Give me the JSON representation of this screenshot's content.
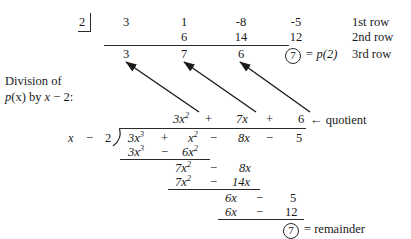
{
  "figure": {
    "title_note": "Synthetic division and long division of p(x) by x - 2",
    "ink_color": "#1a1a1a",
    "rule_color": "#2a2a2a"
  },
  "synthetic": {
    "divisor_value": "2",
    "row1": [
      "3",
      "1",
      "-8",
      "-5"
    ],
    "row2": [
      "6",
      "14",
      "12"
    ],
    "row3": [
      "3",
      "7",
      "6"
    ],
    "circled_value": "7",
    "equals_text": "= p(2)",
    "row_labels": [
      "1st row",
      "2nd row",
      "3rd row"
    ]
  },
  "caption": {
    "line1": "Division of",
    "line2_p": "p",
    "line2_paren": "(x)",
    "line2_by": " by ",
    "line2_x": "x",
    "line2_rest": " − 2:"
  },
  "longdivision": {
    "quotient": {
      "t1_coef": "3",
      "t1_var": "x",
      "t1_exp": "2",
      "op1": "+",
      "t2_coef": "7",
      "t2_var": "x",
      "op2": "+",
      "t3": "6",
      "arrow_label": "← quotient"
    },
    "divisor": {
      "x": "x",
      "minus": "−",
      "two": "2"
    },
    "dividend": {
      "t1_coef": "3",
      "t1_var": "x",
      "t1_exp": "3",
      "op1": "+",
      "t2_var": "x",
      "t2_exp": "2",
      "op2": "−",
      "t3_coef": "8",
      "t3_var": "x",
      "op3": "−",
      "t4": "5"
    },
    "step1": {
      "a_coef": "3",
      "a_var": "x",
      "a_exp": "3",
      "op": "−",
      "b_coef": "6",
      "b_var": "x",
      "b_exp": "2"
    },
    "step2_bring": {
      "a_coef": "7",
      "a_var": "x",
      "a_exp": "2",
      "op": "−",
      "b_coef": "8",
      "b_var": "x"
    },
    "step2": {
      "a_coef": "7",
      "a_var": "x",
      "a_exp": "2",
      "op": "−",
      "b_coef": "14",
      "b_var": "x"
    },
    "step3_bring": {
      "a_coef": "6",
      "a_var": "x",
      "op": "−",
      "b": "5"
    },
    "step3": {
      "a_coef": "6",
      "a_var": "x",
      "op": "−",
      "b": "12"
    },
    "remainder": {
      "circled_value": "7",
      "label": "= remainder"
    }
  }
}
